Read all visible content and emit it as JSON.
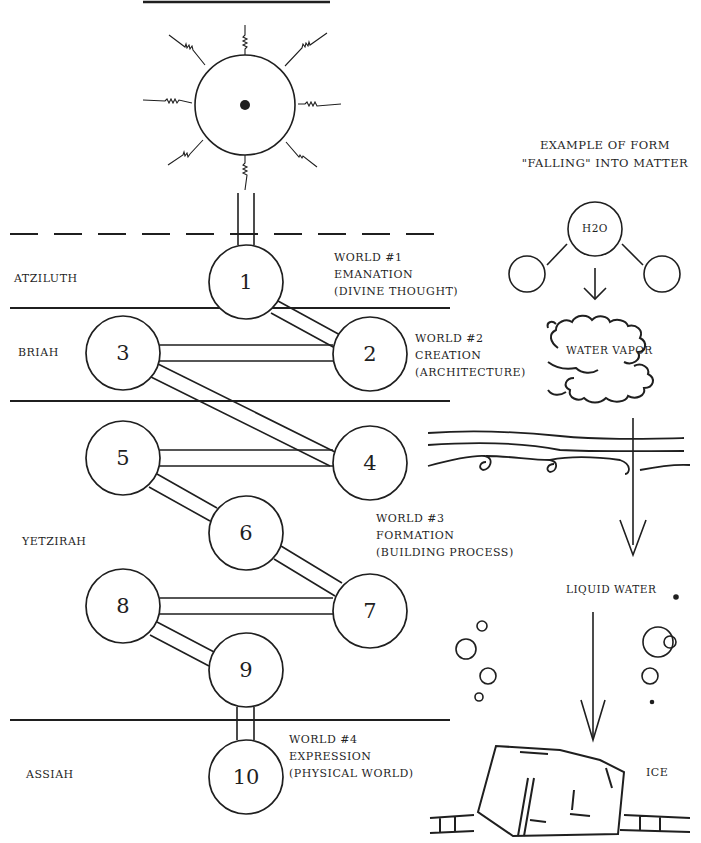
{
  "diagram": {
    "title_bar": "",
    "worlds": [
      {
        "name": "Atziluth",
        "label_lines": [
          "World #1",
          "Emanation",
          "(Divine Thought)"
        ]
      },
      {
        "name": "Briah",
        "label_lines": [
          "World #2",
          "Creation",
          "(Architecture)"
        ]
      },
      {
        "name": "Yetzirah",
        "label_lines": [
          "World #3",
          "Formation",
          "(Building Process)"
        ]
      },
      {
        "name": "Assiah",
        "label_lines": [
          "World #4",
          "Expression",
          "(Physical World)"
        ]
      }
    ],
    "nodes": [
      {
        "id": "1",
        "label": "1",
        "cx": 246,
        "cy": 282
      },
      {
        "id": "2",
        "label": "2",
        "cx": 370,
        "cy": 354
      },
      {
        "id": "3",
        "label": "3",
        "cx": 123,
        "cy": 353
      },
      {
        "id": "4",
        "label": "4",
        "cx": 370,
        "cy": 463
      },
      {
        "id": "5",
        "label": "5",
        "cx": 123,
        "cy": 458
      },
      {
        "id": "6",
        "label": "6",
        "cx": 246,
        "cy": 533
      },
      {
        "id": "7",
        "label": "7",
        "cx": 370,
        "cy": 611
      },
      {
        "id": "8",
        "label": "8",
        "cx": 123,
        "cy": 606
      },
      {
        "id": "9",
        "label": "9",
        "cx": 246,
        "cy": 670
      },
      {
        "id": "10",
        "label": "10",
        "cx": 246,
        "cy": 777
      }
    ],
    "edges": [
      [
        "1",
        "2"
      ],
      [
        "2",
        "3"
      ],
      [
        "3",
        "4"
      ],
      [
        "4",
        "5"
      ],
      [
        "5",
        "6"
      ],
      [
        "6",
        "7"
      ],
      [
        "7",
        "8"
      ],
      [
        "8",
        "9"
      ],
      [
        "9",
        "10"
      ]
    ],
    "source_symbol": "sun-with-center-dot",
    "example": {
      "title_lines": [
        "Example of Form",
        "\"Falling\" into Matter"
      ],
      "molecule_label": "H2O",
      "vapor_label": "Water Vapor",
      "liquid_label": "Liquid Water",
      "ice_label": "Ice"
    }
  }
}
